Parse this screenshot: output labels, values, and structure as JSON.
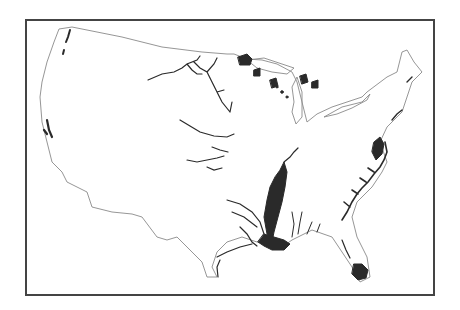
{
  "map": {
    "subject": "Contiguous United States",
    "style": "black-and-white line map",
    "outline_color": "#888888",
    "feature_color": "#2a2a2a",
    "frame_color": "#444444",
    "features": [
      "Mississippi River lower valley (large shaded region)",
      "Mississippi delta / Louisiana coast",
      "Atlantic coast wetlands (Carolinas)",
      "Florida Everglades",
      "Chesapeake Bay area",
      "Great Lakes region patches (Minnesota, Wisconsin, Michigan)",
      "Puget Sound / Washington coast",
      "California Central Valley / Bay area",
      "Missouri River and Great Plains rivers",
      "Gulf Coast rivers (Texas)"
    ]
  }
}
